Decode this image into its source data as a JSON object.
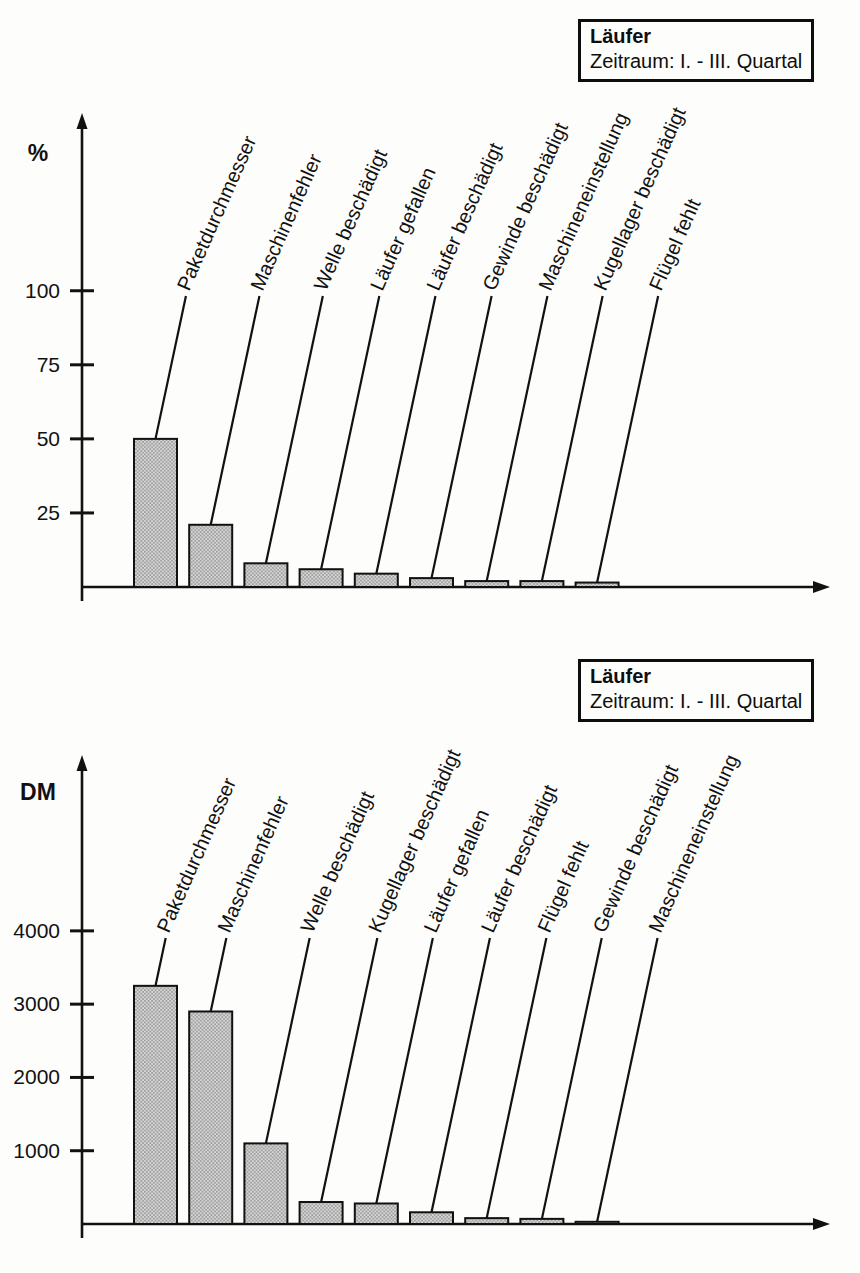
{
  "page_type": "scanned-pareto-analysis",
  "chart_data": [
    {
      "type": "bar",
      "title": "Läufer",
      "subtitle": "Zeitraum: I. - III. Quartal",
      "ylabel": "%",
      "xlabel": "",
      "categories": [
        "Paketdurchmesser",
        "Maschinenfehler",
        "Welle beschädigt",
        "Läufer gefallen",
        "Läufer beschädigt",
        "Gewinde beschädigt",
        "Maschineneinstellung",
        "Kugellager beschädigt",
        "Flügel fehlt"
      ],
      "values": [
        50,
        21,
        8,
        6,
        4.5,
        3,
        2,
        2,
        1.5
      ],
      "yticks": [
        25,
        50,
        75,
        100
      ],
      "ylim": [
        0,
        160
      ],
      "grid": false,
      "legend_position": "top-right",
      "bar_fill": "stippled-gray",
      "label_style": "rotated-callout"
    },
    {
      "type": "bar",
      "title": "Läufer",
      "subtitle": "Zeitraum: I. - III. Quartal",
      "ylabel": "DM",
      "xlabel": "",
      "categories": [
        "Paketdurchmesser",
        "Maschinenfehler",
        "Welle beschädigt",
        "Kugellager beschädigt",
        "Läufer gefallen",
        "Läufer beschädigt",
        "Flügel fehlt",
        "Gewinde beschädigt",
        "Maschineneinstellung"
      ],
      "values": [
        3250,
        2900,
        1100,
        300,
        280,
        160,
        80,
        70,
        30
      ],
      "yticks": [
        1000,
        2000,
        3000,
        4000
      ],
      "ylim": [
        0,
        6400
      ],
      "grid": false,
      "legend_position": "top-right",
      "bar_fill": "stippled-gray",
      "label_style": "rotated-callout"
    }
  ],
  "colors": {
    "ink": "#111111",
    "bar_base": "#d6d6d6",
    "bar_dot": "#878787",
    "paper": "#fdfdfc"
  }
}
